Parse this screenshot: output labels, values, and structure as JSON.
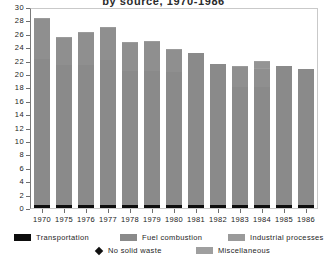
{
  "chart_data": {
    "type": "bar",
    "stacked": true,
    "title": "by source, 1970-1986",
    "xlabel": "",
    "ylabel": "",
    "ylim": [
      0,
      30
    ],
    "ytick_step": 2,
    "grid": false,
    "legend_position": "bottom",
    "categories": [
      "1970",
      "1975",
      "1976",
      "1977",
      "1978",
      "1979",
      "1980",
      "1981",
      "1982",
      "1983",
      "1984",
      "1985",
      "1986"
    ],
    "yticks": [
      "0",
      "2",
      "4",
      "6",
      "8",
      "10",
      "12",
      "14",
      "16",
      "18",
      "20",
      "22",
      "24",
      "26",
      "28",
      "30"
    ],
    "totals": [
      28.2,
      25.4,
      26.1,
      26.8,
      24.7,
      24.8,
      23.6,
      23.2,
      21.5,
      21.1,
      21.6,
      21.2,
      20.7
    ],
    "series": [
      {
        "name": "Transportation",
        "color": "#0d0d0d",
        "values": [
          0.5,
          0.4,
          0.4,
          0.5,
          0.5,
          0.5,
          0.5,
          0.4,
          0.4,
          0.4,
          0.4,
          0.4,
          0.4
        ]
      },
      {
        "name": "Fuel combustion",
        "color": "#8a8a8a",
        "values": [
          21.7,
          21.0,
          21.0,
          21.6,
          19.9,
          19.9,
          19.8,
          22.8,
          21.1,
          17.6,
          17.7,
          20.8,
          20.3
        ]
      },
      {
        "name": "Industrial processes",
        "color": "#8f8f8f",
        "values": [
          6.0,
          4.0,
          4.7,
          4.7,
          4.3,
          4.4,
          3.3,
          0.0,
          0.0,
          3.1,
          2.7,
          0.0,
          0.0
        ]
      },
      {
        "name": "Miscellaneous",
        "color": "#949494",
        "values": [
          0.0,
          0.0,
          0.0,
          0.0,
          0.0,
          0.0,
          0.0,
          0.0,
          0.0,
          0.0,
          0.8,
          0.0,
          0.0
        ]
      }
    ],
    "legend": [
      {
        "label": "Transportation",
        "swatch": "transportation",
        "icon": "square-swatch-icon"
      },
      {
        "label": "Fuel combustion",
        "swatch": "fuel",
        "icon": "square-swatch-icon"
      },
      {
        "label": "Industrial processes",
        "swatch": "industrial",
        "icon": "square-swatch-icon"
      },
      {
        "label": "No solid waste",
        "swatch": "diamond",
        "icon": "diamond-marker-icon"
      },
      {
        "label": "Miscellaneous",
        "swatch": "misc",
        "icon": "square-swatch-icon"
      }
    ]
  },
  "colors": {
    "transportation": "#0d0d0d",
    "fuel_combustion": "#8a8a8a",
    "industrial_processes": "#8f8f8f",
    "miscellaneous": "#949494",
    "axis": "#6f6f6f",
    "frame": "#c9c9c9",
    "text": "#222222",
    "background": "#ffffff"
  }
}
